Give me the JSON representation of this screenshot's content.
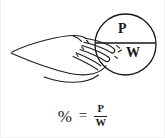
{
  "figure": {
    "kind": "instructional-line-drawing",
    "title_text": "",
    "background_color": "#ffffff",
    "ink_color": "#1d1d1d"
  },
  "circle_diagram": {
    "name": "percent-circle",
    "top_letter": "P",
    "bottom_letter": "W",
    "divider": "horizontal-line",
    "description_text": ""
  },
  "hand": {
    "name": "pointing-hand",
    "description_text": ""
  },
  "formula": {
    "percent_symbol": "%",
    "equals_symbol": "=",
    "numerator": "P",
    "denominator": "W"
  }
}
